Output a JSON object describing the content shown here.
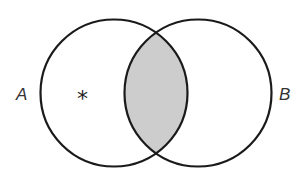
{
  "diagram": {
    "type": "venn",
    "sets": [
      {
        "label": "A",
        "cx": 114,
        "cy": 93,
        "r": 73.5
      },
      {
        "label": "B",
        "cx": 198,
        "cy": 93,
        "r": 73.5
      }
    ],
    "shaded_region": "A ∩ B",
    "marker": {
      "symbol": "*",
      "region": "A only"
    },
    "colors": {
      "stroke": "#1a1a1a",
      "shade": "#cdcdcd",
      "background": "#ffffff"
    }
  },
  "labels": {
    "a": "A",
    "b": "B",
    "marker": "*"
  }
}
